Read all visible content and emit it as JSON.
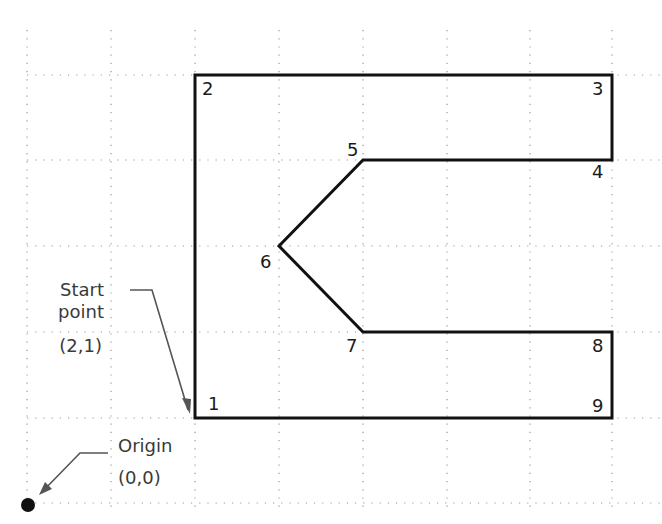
{
  "diagram": {
    "type": "coordinate-grid-drawing",
    "grid": {
      "spacing_units": 1,
      "x_range": [
        0,
        7
      ],
      "y_range": [
        0,
        5
      ],
      "line_style": "dotted",
      "color": "#9a9a9a"
    },
    "shape": {
      "stroke_color": "#111111",
      "vertices": [
        {
          "id": "1",
          "label": "1",
          "x": 2,
          "y": 1
        },
        {
          "id": "2",
          "label": "2",
          "x": 2,
          "y": 5
        },
        {
          "id": "3",
          "label": "3",
          "x": 7,
          "y": 5
        },
        {
          "id": "4",
          "label": "4",
          "x": 7,
          "y": 4
        },
        {
          "id": "5",
          "label": "5",
          "x": 4,
          "y": 4
        },
        {
          "id": "6",
          "label": "6",
          "x": 3,
          "y": 3
        },
        {
          "id": "7",
          "label": "7",
          "x": 4,
          "y": 2
        },
        {
          "id": "8",
          "label": "8",
          "x": 7,
          "y": 2
        },
        {
          "id": "9",
          "label": "9",
          "x": 7,
          "y": 1
        }
      ]
    },
    "annotations": {
      "start_point": {
        "line1": "Start",
        "line2": "point",
        "coords": "(2,1)"
      },
      "origin": {
        "line1": "Origin",
        "coords": "(0,0)"
      }
    }
  }
}
